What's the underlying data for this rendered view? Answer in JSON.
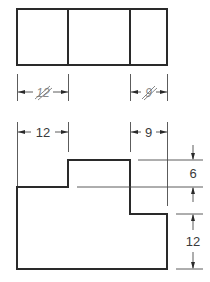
{
  "drawing": {
    "title": "",
    "top_view": {
      "outline": {
        "x": 17,
        "y": 9,
        "w": 150,
        "h": 56
      },
      "dividers_x": [
        68,
        130
      ]
    },
    "dimension_rows": [
      {
        "id": "struck",
        "y": 92,
        "struck_through": true,
        "dims": [
          {
            "label": "12",
            "x1": 17,
            "x2": 68
          },
          {
            "label": "9",
            "x1": 130,
            "x2": 167
          }
        ]
      },
      {
        "id": "correct",
        "y": 132,
        "struck_through": false,
        "dims": [
          {
            "label": "12",
            "x1": 17,
            "x2": 68
          },
          {
            "label": "9",
            "x1": 130,
            "x2": 167
          }
        ]
      }
    ],
    "front_view": {
      "profile_points": "17,187 68,187 68,160 130,160 130,214 167,214 167,269 17,269"
    },
    "vertical_dims": [
      {
        "label": "6",
        "y1": 160,
        "y2": 187,
        "x": 193
      },
      {
        "label": "12",
        "y1": 214,
        "y2": 269,
        "x": 193
      }
    ],
    "colors": {
      "line": "#2a2a2a",
      "text": "#3a3a3a",
      "background": "#ffffff"
    }
  }
}
